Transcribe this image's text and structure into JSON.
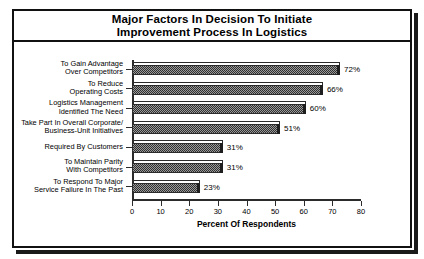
{
  "figure": {
    "title_lines": [
      "Major Factors In Decision To Initiate",
      "Improvement Process In Logistics"
    ]
  },
  "chart_data": {
    "type": "bar",
    "orientation": "horizontal",
    "title": "Major Factors In Decision To Initiate Improvement Process In Logistics",
    "xlabel": "Percent Of Respondents",
    "ylabel": "",
    "xlim": [
      0,
      80
    ],
    "xticks": [
      "0",
      "10",
      "20",
      "30",
      "40",
      "50",
      "60",
      "70",
      "80"
    ],
    "xtick_values": [
      0,
      10,
      20,
      30,
      40,
      50,
      60,
      70,
      80
    ],
    "grid": false,
    "legend": false,
    "categories": [
      "To Gain Advantage Over Competitors",
      "To Reduce Operating Costs",
      "Logistics Management Identified The Need",
      "Take Part In Overall Corporate/ Business-Unit Initiatives",
      "Required By Customers",
      "To Maintain Parity With Competitors",
      "To Respond To Major Service Failure In The Past"
    ],
    "category_label_lines": [
      [
        "To Gain Advantage",
        "Over Competitors"
      ],
      [
        "To Reduce",
        "Operating Costs"
      ],
      [
        "Logistics Management",
        "Identified The Need"
      ],
      [
        "Take Part In Overall Corporate/",
        "Business-Unit Initiatives"
      ],
      [
        "Required By Customers"
      ],
      [
        "To Maintain Parity",
        "With Competitors"
      ],
      [
        "To Respond To Major",
        "Service Failure In The Past"
      ]
    ],
    "values": [
      72,
      66,
      60,
      51,
      31,
      31,
      23
    ],
    "value_labels": [
      "72%",
      "66%",
      "60%",
      "51%",
      "31%",
      "31%",
      "23%"
    ],
    "bar_fill": "#9a9a9a",
    "bar_pattern": "checkered-dither",
    "bar_edge": "#2b2b2b",
    "axis_color": "#2b2b2b",
    "background": "#ffffff"
  }
}
